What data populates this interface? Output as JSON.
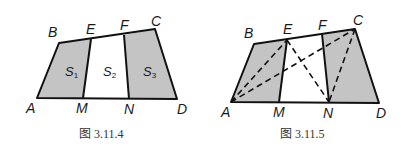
{
  "figures": [
    {
      "caption": "图 3.11.4",
      "labels": {
        "A": "A",
        "B": "B",
        "C": "C",
        "D": "D",
        "E": "E",
        "F": "F",
        "M": "M",
        "N": "N"
      },
      "regions": [
        {
          "name": "S",
          "sub": "1"
        },
        {
          "name": "S",
          "sub": "2"
        },
        {
          "name": "S",
          "sub": "3"
        }
      ]
    },
    {
      "caption": "图 3.11.5",
      "labels": {
        "A": "A",
        "B": "B",
        "C": "C",
        "D": "D",
        "E": "E",
        "F": "F",
        "M": "M",
        "N": "N"
      }
    }
  ],
  "colors": {
    "shade": "#c4c4c4",
    "line": "#111111"
  }
}
